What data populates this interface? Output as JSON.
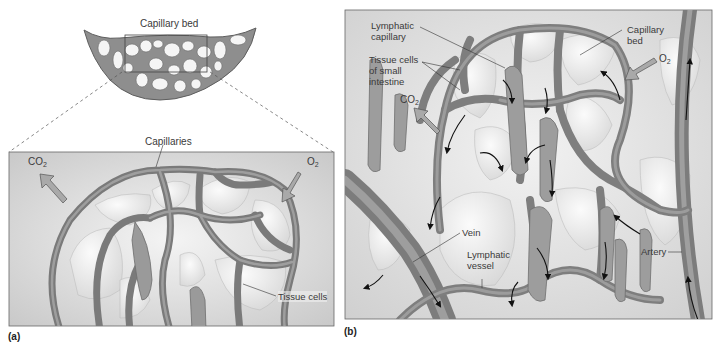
{
  "figure": {
    "panel_a": {
      "letter": "(a)",
      "top_label": "Capillary bed",
      "inset_label": "Capillaries",
      "co2_label": "CO",
      "co2_sub": "2",
      "o2_label": "O",
      "o2_sub": "2",
      "tissue_label": "Tissue cells"
    },
    "panel_b": {
      "letter": "(b)",
      "lymphatic_capillary_1": "Lymphatic",
      "lymphatic_capillary_2": "capillary",
      "tissue_cells_1": "Tissue cells",
      "tissue_cells_2": "of small",
      "tissue_cells_3": "intestine",
      "co2_label": "CO",
      "co2_sub": "2",
      "capillary_bed_1": "Capillary",
      "capillary_bed_2": "bed",
      "o2_label": "O",
      "o2_sub": "2",
      "vein_label": "Vein",
      "lymphatic_vessel_1": "Lymphatic",
      "lymphatic_vessel_2": "vessel",
      "artery_label": "Artery"
    }
  }
}
